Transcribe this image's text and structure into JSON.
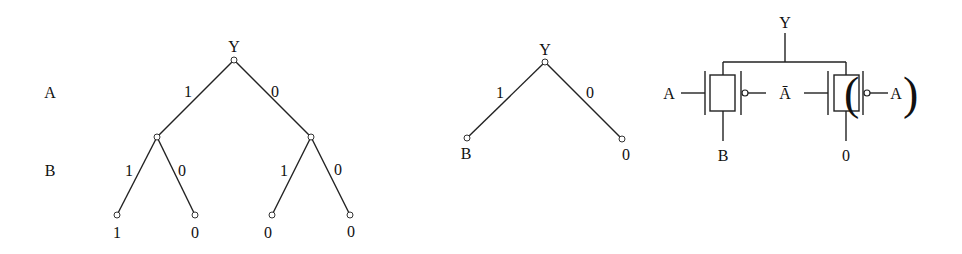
{
  "figure": {
    "decision_tree": {
      "root_label": "Y",
      "row_labels": [
        "A",
        "B"
      ],
      "level1_edges": [
        {
          "label": "1"
        },
        {
          "label": "0"
        }
      ],
      "level2_edges": [
        {
          "label": "1"
        },
        {
          "label": "0"
        },
        {
          "label": "1"
        },
        {
          "label": "0"
        }
      ],
      "leaves": [
        "1",
        "0",
        "0",
        "0"
      ]
    },
    "reduced_tree": {
      "root_label": "Y",
      "edges": [
        {
          "label": "1"
        },
        {
          "label": "0"
        }
      ],
      "leaves": [
        "B",
        "0"
      ]
    },
    "transmission_gate_circuit": {
      "output_label": "Y",
      "gate1": {
        "nmos_gate_input": "A",
        "pmos_gate_input": "Ā",
        "data_input": "B"
      },
      "gate2": {
        "nmos_gate_input": "Ā",
        "pmos_gate_input": "A",
        "data_input": "0",
        "open_paren": "(",
        "close_paren": ")"
      }
    }
  }
}
